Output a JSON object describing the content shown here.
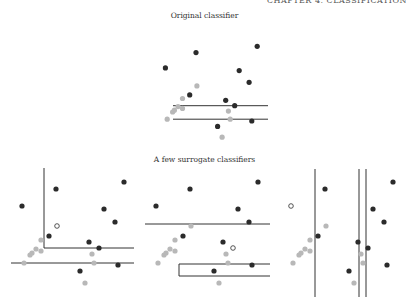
{
  "header": {
    "running_head": "CHAPTER 4. CLASSIFICATION"
  },
  "figure": {
    "title_original": "Original classifier",
    "title_surrogates": "A few surrogate classifiers",
    "colors": {
      "class_dark": "#2b2b2b",
      "class_light": "#b8b8b8",
      "boundary": "#333333",
      "highlight_fill": "#ffffff"
    }
  },
  "chart_data": {
    "type": "scatter",
    "title": "",
    "xlabel": "",
    "ylabel": "",
    "grid": false,
    "xlim": [
      0,
      125
    ],
    "ylim": [
      0,
      115
    ],
    "series": [
      {
        "name": "class_dark",
        "points": [
          [
            45,
            101
          ],
          [
            113,
            108
          ],
          [
            11,
            84
          ],
          [
            93,
            81
          ],
          [
            104,
            68
          ],
          [
            38,
            54
          ],
          [
            78,
            48
          ],
          [
            88,
            42
          ],
          [
            107,
            25
          ],
          [
            69,
            19
          ]
        ]
      },
      {
        "name": "class_light",
        "points": [
          [
            46,
            64
          ],
          [
            30,
            50
          ],
          [
            25,
            41
          ],
          [
            21,
            37
          ],
          [
            19,
            35
          ],
          [
            30,
            39
          ],
          [
            13,
            27
          ],
          [
            81,
            36
          ],
          [
            83,
            27
          ],
          [
            74,
            7
          ]
        ]
      }
    ],
    "panels": [
      {
        "name": "original",
        "highlight": null,
        "boundaries": [
          {
            "type": "hline",
            "y": 42,
            "x0": 0,
            "x1": 125
          },
          {
            "type": "hline",
            "y": 27,
            "x0": 0,
            "x1": 125
          }
        ]
      },
      {
        "name": "surrogate-1",
        "highlight": {
          "series": "class_light",
          "index": 0
        },
        "boundaries": [
          {
            "type": "vline",
            "x": 33,
            "y0": 42,
            "y1": 122
          },
          {
            "type": "hline",
            "y": 42,
            "x0": 33,
            "x1": 125
          },
          {
            "type": "hline",
            "y": 27,
            "x0": 0,
            "x1": 125
          }
        ]
      },
      {
        "name": "surrogate-2",
        "highlight": {
          "series": "class_dark",
          "index": 7
        },
        "boundaries": [
          {
            "type": "hline",
            "y": 66,
            "x0": 0,
            "x1": 125
          },
          {
            "type": "box",
            "x0": 34,
            "x1": 125,
            "y0": 14,
            "y1": 26
          }
        ]
      },
      {
        "name": "surrogate-3",
        "highlight": {
          "series": "class_dark",
          "index": 2
        },
        "boundaries": [
          {
            "type": "vline",
            "x": 35,
            "y0": -7,
            "y1": 121
          },
          {
            "type": "vline",
            "x": 79,
            "y0": -7,
            "y1": 121
          },
          {
            "type": "vline",
            "x": 86,
            "y0": -7,
            "y1": 121
          }
        ]
      }
    ]
  }
}
